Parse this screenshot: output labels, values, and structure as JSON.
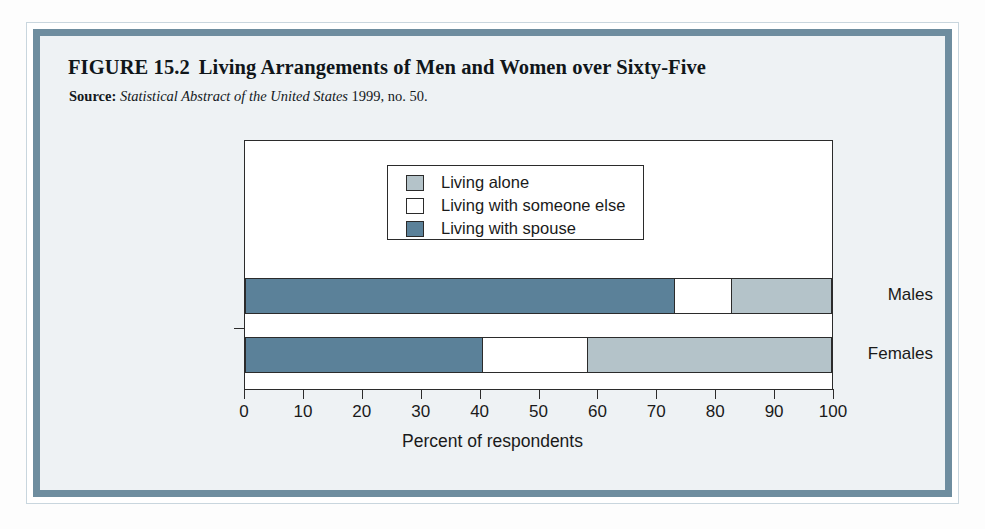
{
  "figure": {
    "label": "FIGURE 15.2",
    "title": "Living Arrangements of Men and Women over Sixty-Five",
    "source_label": "Source:",
    "source_italic": "Statistical Abstract of the United States",
    "source_rest": " 1999, no. 50."
  },
  "colors": {
    "living_alone": "#b4c3c9",
    "living_with_someone_else": "#ffffff",
    "living_with_spouse": "#5b8199",
    "border": "#6e8d9f",
    "panel_background": "#eef2f4",
    "axis": "#2b2b2b"
  },
  "legend": {
    "position": "inside-top-center",
    "items": [
      {
        "label": "Living alone",
        "swatch": "living-alone-swatch"
      },
      {
        "label": "Living with someone else",
        "swatch": "living-with-someone-else-swatch"
      },
      {
        "label": "Living with spouse",
        "swatch": "living-with-spouse-swatch"
      }
    ]
  },
  "chart_data": {
    "type": "bar",
    "orientation": "horizontal",
    "stacked": true,
    "title": "Living Arrangements of Men and Women over Sixty-Five",
    "subtitle": "",
    "categories": [
      "Males",
      "Females"
    ],
    "series": [
      {
        "name": "Living with spouse",
        "values": [
          73,
          40.5
        ],
        "color": "#5b8199"
      },
      {
        "name": "Living with someone else",
        "values": [
          10,
          18
        ],
        "color": "#ffffff"
      },
      {
        "name": "Living alone",
        "values": [
          17,
          41.5
        ],
        "color": "#b4c3c9"
      }
    ],
    "xlabel": "Percent of respondents",
    "ylabel": "",
    "xlim": [
      0,
      100
    ],
    "xticks": [
      0,
      10,
      20,
      30,
      40,
      50,
      60,
      70,
      80,
      90,
      100
    ],
    "xticklabels": [
      "0",
      "10",
      "20",
      "30",
      "40",
      "50",
      "60",
      "70",
      "80",
      "90",
      "100"
    ],
    "grid": false,
    "legend_position": "inside-top-center"
  }
}
